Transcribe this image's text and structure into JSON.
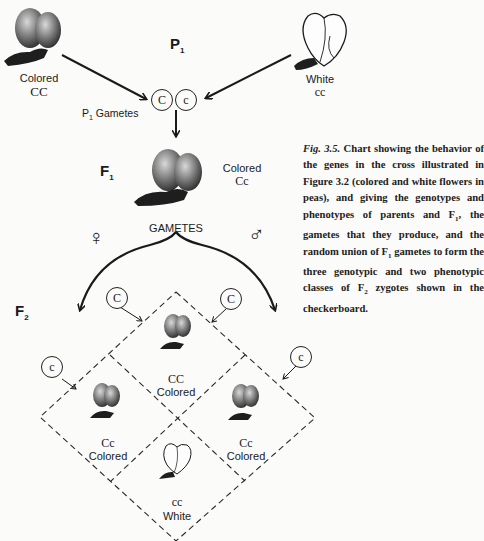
{
  "top_fragment": ", ... ghng ...",
  "parents": {
    "generation_label": "P",
    "generation_sub": "1",
    "left": {
      "phenotype": "Colored",
      "genotype": "CC",
      "flower": "colored-flower"
    },
    "right": {
      "phenotype": "White",
      "genotype": "cc",
      "flower": "white-flower"
    },
    "gametes_label": "P",
    "gametes_label_sub": "1",
    "gametes_label_text": " Gametes",
    "gametes": [
      "C",
      "c"
    ]
  },
  "f1": {
    "generation_label": "F",
    "generation_sub": "1",
    "phenotype": "Colored",
    "genotype": "Cc",
    "gametes_heading": "GAMETES",
    "female_symbol": "♀",
    "male_symbol": "♂"
  },
  "f2": {
    "generation_label": "F",
    "generation_sub": "2",
    "female_gametes": [
      "C",
      "c"
    ],
    "male_gametes": [
      "C",
      "c"
    ],
    "cells": [
      {
        "genotype": "CC",
        "phenotype": "Colored",
        "flower": "colored"
      },
      {
        "genotype": "Cc",
        "phenotype": "Colored",
        "flower": "colored"
      },
      {
        "genotype": "Cc",
        "phenotype": "Colored",
        "flower": "colored"
      },
      {
        "genotype": "cc",
        "phenotype": "White",
        "flower": "white"
      }
    ]
  },
  "caption": {
    "fig_label": "Fig. 3.5.",
    "text_1": " Chart showing the behavior of the genes in the cross illustrated in Figure 3.2 (colored and white flowers in peas), and giving the genotypes and phenotypes of parents and F",
    "sub_1": "1",
    "text_2": ", the gametes that they produce, and the random union of F",
    "sub_2": "1",
    "text_3": " gametes to form the three genotypic and two phenotypic classes of F",
    "sub_3": "2",
    "text_4": " zygotes shown in the checkerboard."
  },
  "colors": {
    "ink": "#1a1a1a",
    "paper": "#fbfbf9",
    "ghost": "#d8d8d4"
  }
}
